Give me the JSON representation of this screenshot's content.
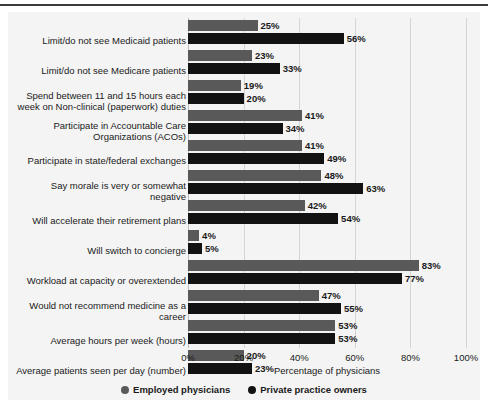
{
  "chart_data": {
    "type": "bar",
    "orientation": "horizontal",
    "title": "",
    "xlabel": "Percentage of physicians",
    "ylabel": "",
    "xlim": [
      0,
      100
    ],
    "xticks": [
      "0%",
      "20%",
      "40%",
      "60%",
      "80%",
      "100%"
    ],
    "xtick_values": [
      0,
      20,
      40,
      60,
      80,
      100
    ],
    "grid": true,
    "legend_position": "bottom-center",
    "categories": [
      "Limit/do not see Medicaid patients",
      "Limit/do not see Medicare patients",
      "Spend between 11 and 15 hours each week on Non-clinical (paperwork) duties",
      "Participate in Accountable Care Organizations (ACOs)",
      "Participate in state/federal exchanges",
      "Say morale is very or somewhat negative",
      "Will accelerate their retirement plans",
      "Will switch to concierge",
      "Workload at capacity or overextended",
      "Would not recommend medicine as a career",
      "Average hours per week (hours)",
      "Average patients seen per day (number)"
    ],
    "category_lines": [
      [
        "Limit/do not see Medicaid patients"
      ],
      [
        "Limit/do not see Medicare patients"
      ],
      [
        "Spend between 11 and 15 hours each",
        "week on Non-clinical (paperwork) duties"
      ],
      [
        "Participate in Accountable Care",
        "Organizations (ACOs)"
      ],
      [
        "Participate in state/federal exchanges"
      ],
      [
        "Say morale is very or somewhat",
        "negative"
      ],
      [
        "Will accelerate their retirement plans"
      ],
      [
        "Will switch to concierge"
      ],
      [
        "Workload at capacity or overextended"
      ],
      [
        "Would not recommend medicine as a",
        "career"
      ],
      [
        "Average hours per week (hours)"
      ],
      [
        "Average patients seen per day (number)"
      ]
    ],
    "series": [
      {
        "name": "Employed physicians",
        "color": "#595959",
        "values": [
          25,
          23,
          19,
          41,
          41,
          48,
          42,
          4,
          83,
          47,
          53,
          20
        ],
        "labels": [
          "25%",
          "23%",
          "19%",
          "41%",
          "41%",
          "48%",
          "42%",
          "4%",
          "83%",
          "47%",
          "53%",
          "20%"
        ]
      },
      {
        "name": "Private practice owners",
        "color": "#121212",
        "values": [
          56,
          33,
          20,
          34,
          49,
          63,
          54,
          5,
          77,
          55,
          53,
          23
        ],
        "labels": [
          "56%",
          "33%",
          "20%",
          "34%",
          "49%",
          "63%",
          "54%",
          "5%",
          "77%",
          "55%",
          "53%",
          "23%"
        ]
      }
    ]
  },
  "legend": {
    "items": [
      {
        "label": "Employed physicians",
        "color": "#595959"
      },
      {
        "label": "Private practice owners",
        "color": "#121212"
      }
    ]
  }
}
